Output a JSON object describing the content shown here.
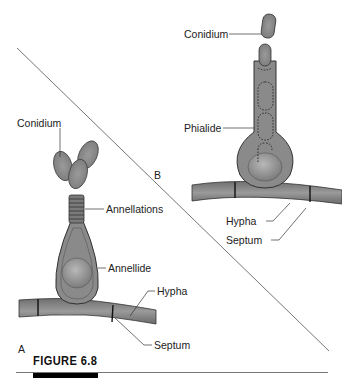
{
  "figure": {
    "caption": "FIGURE 6.8",
    "panels": [
      {
        "id": "A",
        "label": "A",
        "structures": {
          "conidium": "Conidium",
          "annellations": "Annellations",
          "annellide": "Annellide",
          "hypha": "Hypha",
          "septum": "Septum"
        }
      },
      {
        "id": "B",
        "label": "B",
        "structures": {
          "conidium": "Conidium",
          "phialide": "Phialide",
          "hypha": "Hypha",
          "septum": "Septum"
        }
      }
    ]
  },
  "colors": {
    "cell_fill": "#8a8a8a",
    "cell_outline": "#3a3a3a",
    "nucleus_fill": "#a6a6a6",
    "septum": "#111111",
    "divider_line": "#666666"
  }
}
